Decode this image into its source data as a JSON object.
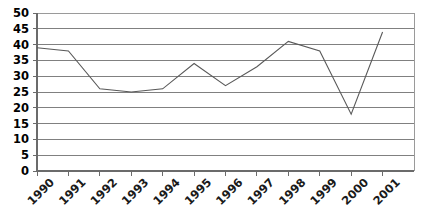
{
  "chart_data": {
    "type": "line",
    "title": "",
    "subtitle": "",
    "xlabel": "",
    "ylabel": "",
    "categories": [
      "1990",
      "1991",
      "1992",
      "1993",
      "1994",
      "1995",
      "1996",
      "1997",
      "1998",
      "1999",
      "2000",
      "2001"
    ],
    "x": [
      1990,
      1991,
      1992,
      1993,
      1994,
      1995,
      1996,
      1997,
      1998,
      1999,
      2000,
      2001
    ],
    "values": [
      39,
      38,
      26,
      25,
      26,
      34,
      27,
      33,
      41,
      38,
      18,
      44
    ],
    "series": [
      {
        "name": "",
        "values": [
          39,
          38,
          26,
          25,
          26,
          34,
          27,
          33,
          41,
          38,
          18,
          44
        ]
      }
    ],
    "ylim": [
      0,
      50
    ],
    "yticks": [
      0,
      5,
      10,
      15,
      20,
      25,
      30,
      35,
      40,
      45,
      50
    ],
    "ytick_labels": [
      "0",
      "5",
      "10",
      "15",
      "20",
      "25",
      "30",
      "35",
      "40",
      "45",
      "50"
    ],
    "xtick_labels": [
      "1990",
      "1991",
      "1992",
      "1993",
      "1994",
      "1995",
      "1996",
      "1997",
      "1998",
      "1999",
      "2000",
      "2001"
    ],
    "xtick_label_rotation_deg": -45,
    "grid": "horizontal",
    "legend": "none",
    "line_color": "#595959",
    "grid_color": "#808080",
    "axis_color": "#6b6b6b",
    "background_color": "#ffffff",
    "markers": "none",
    "annotations": []
  }
}
